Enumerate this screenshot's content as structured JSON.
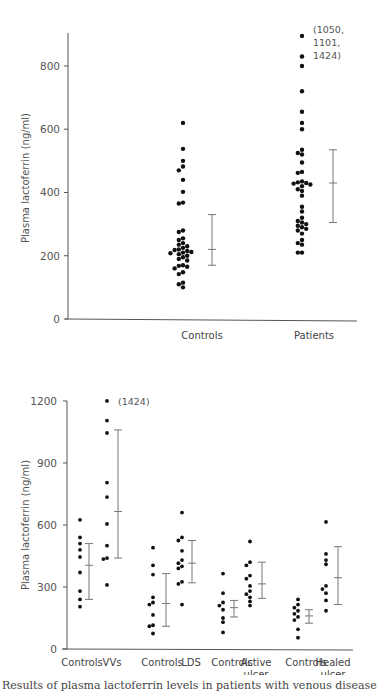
{
  "chart_data": [
    {
      "type": "scatter",
      "subtype": "dot-strip-with-error-bars",
      "title": "",
      "xlabel": "",
      "ylabel": "Plasma lactoferrin (ng/ml)",
      "ylim": [
        0,
        900
      ],
      "yticks": [
        0,
        200,
        400,
        600,
        800
      ],
      "grid": false,
      "legend": null,
      "categories": [
        "Controls",
        "Patients"
      ],
      "series": [
        {
          "name": "Controls",
          "values": [
            620,
            538,
            500,
            482,
            470,
            440,
            402,
            368,
            365,
            280,
            275,
            255,
            250,
            240,
            235,
            230,
            225,
            220,
            218,
            215,
            212,
            210,
            208,
            205,
            200,
            195,
            190,
            185,
            170,
            168,
            165,
            160,
            148,
            142,
            115,
            110,
            100
          ],
          "error_bar": {
            "mean": 220,
            "low": 170,
            "high": 330
          }
        },
        {
          "name": "Patients",
          "values": [
            895,
            830,
            800,
            720,
            655,
            620,
            600,
            535,
            525,
            520,
            495,
            465,
            462,
            435,
            432,
            430,
            428,
            425,
            420,
            410,
            405,
            390,
            355,
            340,
            320,
            310,
            305,
            300,
            295,
            290,
            285,
            280,
            270,
            250,
            240,
            235,
            210,
            210
          ],
          "error_bar": {
            "mean": 430,
            "low": 305,
            "high": 535
          }
        }
      ],
      "annotations": [
        {
          "text": "(1050, 1101, 1424)",
          "near": "Patients top"
        }
      ]
    },
    {
      "type": "scatter",
      "subtype": "dot-strip-with-error-bars",
      "title": "",
      "xlabel": "",
      "ylabel": "Plasma lactoferrin (ng/ml)",
      "ylim": [
        0,
        1200
      ],
      "yticks": [
        0,
        300,
        600,
        900,
        1200
      ],
      "grid": false,
      "legend": null,
      "categories": [
        "Controls",
        "VVs",
        "Controls",
        "LDS",
        "Controls",
        "Active ulcer",
        "Controls",
        "Healed ulcer"
      ],
      "series": [
        {
          "name": "Controls (VVs)",
          "values": [
            625,
            540,
            510,
            480,
            445,
            370,
            280,
            240,
            205
          ],
          "error_bar": {
            "mean": 405,
            "low": 240,
            "high": 510
          }
        },
        {
          "name": "VVs",
          "values": [
            1200,
            1105,
            1045,
            805,
            735,
            605,
            500,
            440,
            435,
            310
          ],
          "error_bar": {
            "mean": 665,
            "low": 440,
            "high": 1060
          }
        },
        {
          "name": "Controls (LDS)",
          "values": [
            490,
            405,
            360,
            250,
            225,
            215,
            165,
            115,
            110,
            75
          ],
          "error_bar": {
            "mean": 220,
            "low": 110,
            "high": 365
          }
        },
        {
          "name": "LDS",
          "values": [
            660,
            540,
            525,
            475,
            430,
            415,
            400,
            390,
            325,
            315,
            215
          ],
          "error_bar": {
            "mean": 415,
            "low": 320,
            "high": 525
          }
        },
        {
          "name": "Controls (Active ulcer)",
          "values": [
            365,
            270,
            225,
            210,
            190,
            150,
            130,
            80
          ],
          "error_bar": {
            "mean": 200,
            "low": 155,
            "high": 235
          }
        },
        {
          "name": "Active ulcer",
          "values": [
            520,
            420,
            405,
            355,
            340,
            305,
            280,
            265,
            250,
            230,
            210
          ],
          "error_bar": {
            "mean": 315,
            "low": 245,
            "high": 420
          }
        },
        {
          "name": "Controls (Healed ulcer)",
          "values": [
            240,
            215,
            200,
            185,
            170,
            155,
            140,
            95,
            55
          ],
          "error_bar": {
            "mean": 160,
            "low": 125,
            "high": 190
          }
        },
        {
          "name": "Healed ulcer",
          "values": [
            615,
            460,
            430,
            410,
            305,
            290,
            270,
            235,
            185
          ],
          "error_bar": {
            "mean": 345,
            "low": 215,
            "high": 495
          }
        }
      ],
      "annotations": [
        {
          "text": "(1424)",
          "near": "VVs top"
        }
      ]
    }
  ],
  "top": {
    "ylabel": "Plasma lactoferrin (ng/ml)",
    "yticks": [
      "0",
      "200",
      "400",
      "600",
      "800"
    ],
    "categories": [
      "Controls",
      "Patients"
    ],
    "annotation_lines": [
      "(1050,",
      "1101,",
      "1424)"
    ]
  },
  "bottom": {
    "ylabel": "Plasma lactoferrin (ng/ml)",
    "yticks": [
      "0",
      "300",
      "600",
      "900",
      "1200"
    ],
    "categories": [
      {
        "line1": "Controls",
        "line2": ""
      },
      {
        "line1": "VVs",
        "line2": ""
      },
      {
        "line1": "Controls",
        "line2": ""
      },
      {
        "line1": "LDS",
        "line2": ""
      },
      {
        "line1": "Controls",
        "line2": ""
      },
      {
        "line1": "Active",
        "line2": "ulcer"
      },
      {
        "line1": "Controls",
        "line2": ""
      },
      {
        "line1": "Healed",
        "line2": "ulcer"
      }
    ],
    "annotation": "(1424)"
  },
  "caption": "Results of plasma lactoferrin levels in patients with venous disease"
}
